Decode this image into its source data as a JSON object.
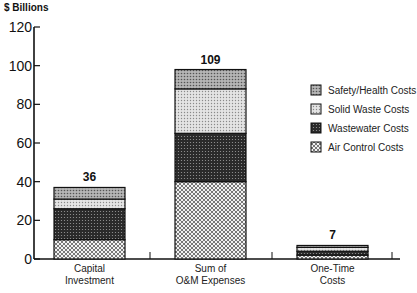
{
  "chart_data": {
    "type": "bar",
    "stacked": true,
    "title": "",
    "ylabel": "$ Billions",
    "xlabel": "",
    "ylim": [
      0,
      120
    ],
    "yticks": [
      0,
      20,
      40,
      60,
      80,
      100,
      120
    ],
    "grid": false,
    "legend_position": "right",
    "categories": [
      [
        "Capital",
        "Investment"
      ],
      [
        "Sum of",
        "O&M Expenses"
      ],
      [
        "One-Time",
        "Costs"
      ]
    ],
    "totals": [
      "36",
      "109",
      "7"
    ],
    "series": [
      {
        "name": "Air Control Costs",
        "values": [
          10,
          40,
          2
        ],
        "pattern": "crosshatch",
        "color": "#e8e8e8"
      },
      {
        "name": "Wastewater Costs",
        "values": [
          16,
          25,
          2
        ],
        "pattern": "dense-dots",
        "color": "#3a3a3a"
      },
      {
        "name": "Solid Waste Costs",
        "values": [
          5,
          23,
          2
        ],
        "pattern": "light-dots",
        "color": "#cfcfcf"
      },
      {
        "name": "Safety/Health Costs",
        "values": [
          6,
          10,
          1
        ],
        "pattern": "medium-dots",
        "color": "#9a9a9a"
      }
    ],
    "legend_order": [
      "Safety/Health Costs",
      "Solid Waste Costs",
      "Wastewater Costs",
      "Air Control Costs"
    ]
  }
}
